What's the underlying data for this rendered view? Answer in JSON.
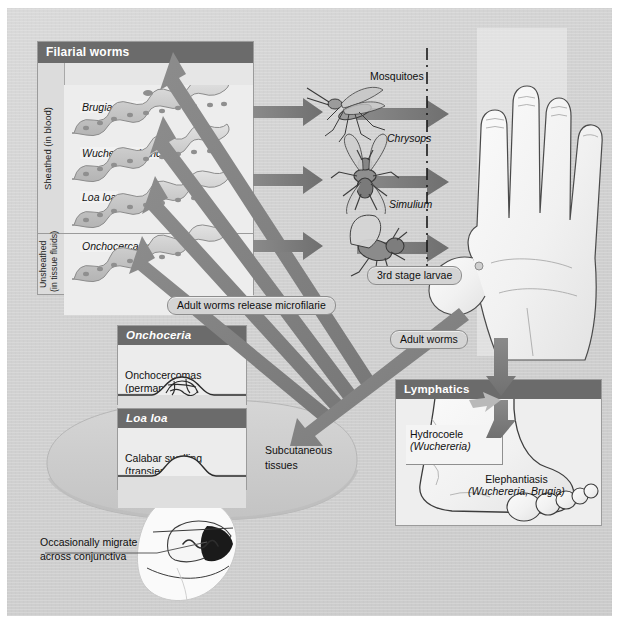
{
  "figure": {
    "background_color": "#d2d2d2",
    "accent_header_color": "#6b6b6b",
    "arrow_color": "#7d7d7d"
  },
  "worms_panel": {
    "header": "Filarial worms",
    "legend": {
      "nuclei_label": "Nuclei"
    },
    "groups": [
      {
        "side_label": "Sheathed (in blood)",
        "species": [
          "Brugia malayi",
          "Wuchereria bancrofti",
          "Loa loa"
        ]
      },
      {
        "side_label": "Unsheathed\n(in tissue fluids)",
        "side_label_line1": "Unsheathed",
        "side_label_line2": "(in tissue fluids)",
        "species": [
          "Onchocerca volvulus"
        ]
      }
    ]
  },
  "vectors": {
    "items": [
      {
        "name": "Mosquitoes",
        "italic": false
      },
      {
        "name": "Chrysops",
        "italic": true
      },
      {
        "name": "Simulium",
        "italic": true
      }
    ],
    "transmission_label": "3rd stage larvae"
  },
  "callouts": {
    "microfilarie": "Adult worms release microfilarie",
    "adult_worms": "Adult worms"
  },
  "lesions": {
    "onchoceria": {
      "header": "Onchoceria",
      "line1": "Onchocercomas",
      "line2": "(permanent)"
    },
    "loa_loa": {
      "header": "Loa loa",
      "line1": "Calabar swelling",
      "line2": "(transient)"
    },
    "conjunctiva_note_line1": "Occasionally migrate",
    "conjunctiva_note_line2": "across conjunctiva"
  },
  "tissues": {
    "subcutaneous_line1": "Subcutaneous",
    "subcutaneous_line2": "tissues"
  },
  "lymphatics": {
    "header": "Lymphatics",
    "hydrocoele": {
      "name": "Hydrocoele",
      "organism": "(Wuchereria)"
    },
    "elephantiasis": {
      "name": "Elephantiasis",
      "organism": "(Wuchereria, Brugia)"
    }
  }
}
